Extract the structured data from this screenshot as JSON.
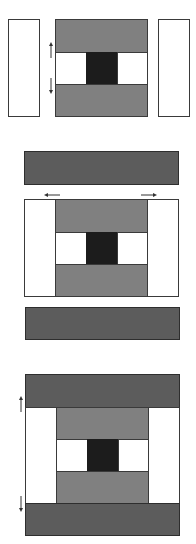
{
  "diagram": {
    "type": "quilt-block-assembly",
    "colors": {
      "white": "#ffffff",
      "medium_gray": "#808080",
      "dark_gray": "#5c5c5c",
      "black_center": "#1c1c1c",
      "outline": "#3a3a3a"
    },
    "steps": [
      {
        "step": 1,
        "description": "Side white strips placed beside nine-patch center unit; pressing arrows point outward toward gray strips"
      },
      {
        "step": 2,
        "description": "Dark gray strips placed above and below; pressing arrows point outward toward side strips"
      },
      {
        "step": 3,
        "description": "Completed block; pressing arrows point toward dark gray strips"
      }
    ]
  }
}
